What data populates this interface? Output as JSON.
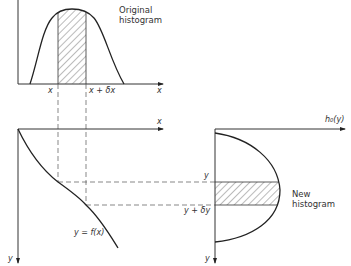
{
  "top_plot": {
    "title_line1": "Original",
    "title_line2": "histogram",
    "x_axis_label": "x",
    "tick_x": "x",
    "tick_x_dx": "x + δx"
  },
  "bottom_left_plot": {
    "x_axis_label": "x",
    "y_axis_label": "y",
    "curve_label": "y = f(x)"
  },
  "right_plot": {
    "h_axis_label": "h₀(y)",
    "y_axis_label": "y",
    "tick_y": "y",
    "tick_y_dy": "y + δy",
    "title_line1": "New",
    "title_line2": "histogram"
  }
}
